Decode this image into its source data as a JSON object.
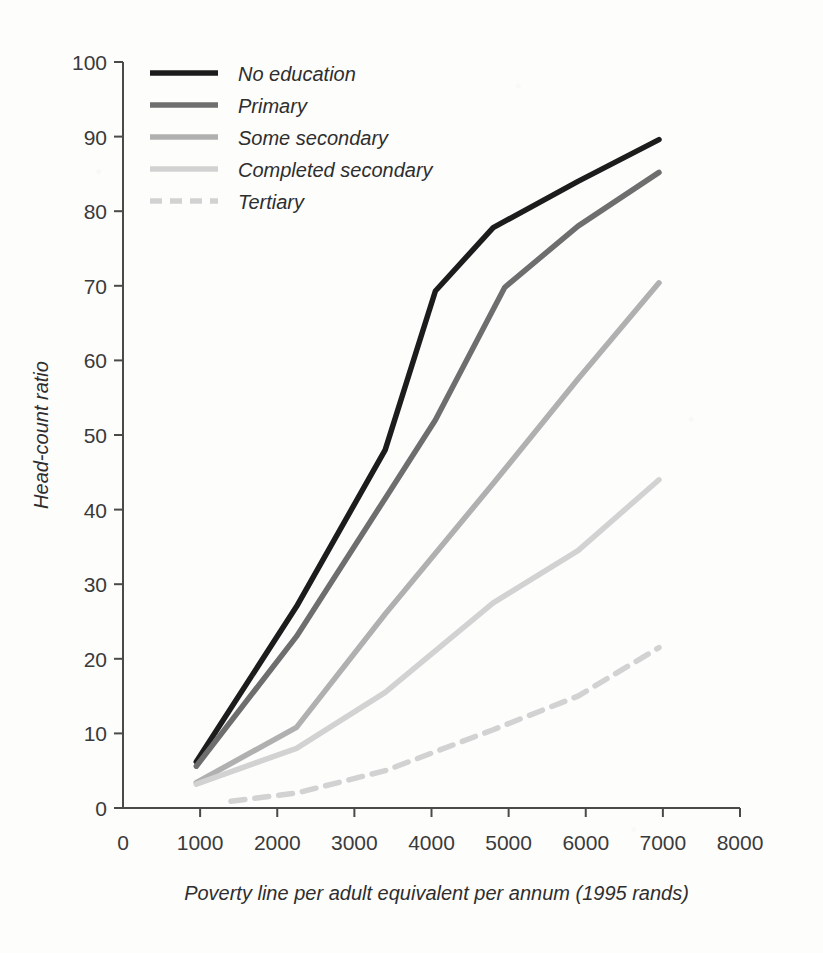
{
  "chart_data": {
    "type": "line",
    "title": "",
    "subtitle": "",
    "xlabel": "Poverty line per adult equivalent per annum (1995 rands)",
    "ylabel": "Head-count ratio",
    "xlim": [
      0,
      8000
    ],
    "ylim": [
      0,
      100
    ],
    "xticks": [
      0,
      1000,
      2000,
      3000,
      4000,
      5000,
      6000,
      7000,
      8000
    ],
    "yticks": [
      0,
      10,
      20,
      30,
      40,
      50,
      60,
      70,
      80,
      90,
      100
    ],
    "xtick_labels": [
      "0",
      "1000",
      "2000",
      "3000",
      "4000",
      "5000",
      "6000",
      "7000",
      "8000"
    ],
    "ytick_labels": [
      "0",
      "10",
      "20",
      "30",
      "40",
      "50",
      "60",
      "70",
      "80",
      "90",
      "100"
    ],
    "grid": false,
    "legend_position": "top-left",
    "series": [
      {
        "name": "No education",
        "color": "#1c1c1c",
        "width": 5.5,
        "dash": "none",
        "x": [
          950,
          2250,
          3400,
          4050,
          4800,
          5900,
          6950
        ],
        "y": [
          6.2,
          27.0,
          48.0,
          69.3,
          77.8,
          84.0,
          89.6
        ]
      },
      {
        "name": "Primary",
        "color": "#6e6e6e",
        "width": 5.5,
        "dash": "none",
        "x": [
          950,
          2250,
          3400,
          4050,
          4950,
          5900,
          6950
        ],
        "y": [
          5.6,
          23.0,
          41.5,
          52.0,
          69.8,
          78.0,
          85.2
        ]
      },
      {
        "name": "Some secondary",
        "color": "#b0b0b0",
        "width": 5.5,
        "dash": "none",
        "x": [
          950,
          2250,
          3400,
          4800,
          5900,
          6950
        ],
        "y": [
          3.4,
          10.8,
          26.0,
          43.5,
          57.5,
          70.4
        ]
      },
      {
        "name": "Completed secondary",
        "color": "#d2d2d2",
        "width": 5.5,
        "dash": "none",
        "x": [
          950,
          2250,
          3400,
          4800,
          5900,
          6950
        ],
        "y": [
          3.2,
          8.0,
          15.5,
          27.5,
          34.5,
          44.0
        ]
      },
      {
        "name": "Tertiary",
        "color": "#d2d2d2",
        "width": 5.5,
        "dash": "dashed",
        "x": [
          1400,
          2250,
          3400,
          4800,
          5900,
          6950
        ],
        "y": [
          0.9,
          2.0,
          5.0,
          10.5,
          15.0,
          21.5
        ]
      }
    ]
  },
  "legend": {
    "entries": [
      {
        "label": "No education"
      },
      {
        "label": "Primary"
      },
      {
        "label": "Some secondary"
      },
      {
        "label": "Completed secondary"
      },
      {
        "label": "Tertiary"
      }
    ]
  },
  "axes": {
    "x_title": "Poverty line per adult equivalent per annum (1995 rands)",
    "y_title": "Head-count ratio"
  }
}
